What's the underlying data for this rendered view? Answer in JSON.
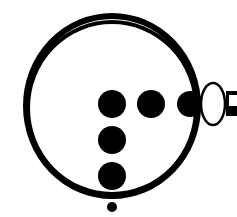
{
  "figure": {
    "colors": {
      "ink": "#000000",
      "paper": "#ffffff"
    },
    "ring": {
      "cx": 112,
      "cy": 106,
      "rx": 86,
      "ry": 90
    },
    "dots": [
      {
        "cx": 112,
        "cy": 104,
        "r": 14
      },
      {
        "cx": 151,
        "cy": 104,
        "r": 14
      },
      {
        "cx": 190,
        "cy": 104,
        "r": 13
      },
      {
        "cx": 112,
        "cy": 140,
        "r": 14
      },
      {
        "cx": 112,
        "cy": 176,
        "r": 14
      },
      {
        "cx": 112,
        "cy": 207,
        "r": 5
      }
    ],
    "oval": {
      "cx": 213,
      "cy": 104,
      "rx": 12,
      "ry": 21
    },
    "handle": {
      "x": 226,
      "y": 91,
      "width": 11,
      "height": 25
    }
  }
}
